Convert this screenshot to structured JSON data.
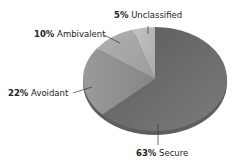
{
  "chart_data": {
    "type": "pie",
    "title": "",
    "categories": [
      "Secure",
      "Avoidant",
      "Ambivalent",
      "Unclassified"
    ],
    "values": [
      63,
      22,
      10,
      5
    ],
    "unit": "%",
    "colors": [
      "#6e6e6e",
      "#8c8c8c",
      "#a6a6a6",
      "#bdbdbd"
    ],
    "start_angle": "12 o'clock",
    "direction": "clockwise",
    "style": "3d-tilted",
    "legend": "none",
    "labels": [
      {
        "pct": "63%",
        "name": "Secure"
      },
      {
        "pct": "22%",
        "name": "Avoidant"
      },
      {
        "pct": "10%",
        "name": "Ambivalent"
      },
      {
        "pct": "5%",
        "name": "Unclassified"
      }
    ]
  }
}
